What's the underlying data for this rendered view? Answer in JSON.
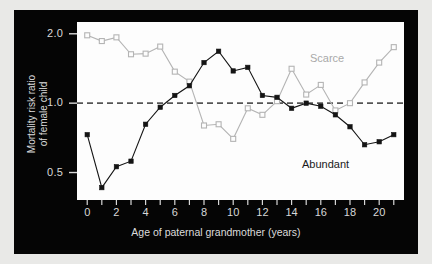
{
  "chart_data": {
    "type": "line",
    "title": "",
    "xlabel": "Age of paternal grandmother (years)",
    "ylabel": "Mortality risk ratio of female child",
    "ylabel_lines": [
      "Mortality risk ratio",
      "of female child"
    ],
    "yscale": "log",
    "ylim": [
      0.38,
      2.25
    ],
    "xlim": [
      -0.7,
      21.7
    ],
    "ytick_labels": [
      "2.0",
      "1.0",
      "0.5"
    ],
    "ytick_values": [
      2.0,
      1.0,
      0.5
    ],
    "xtick_labels": [
      "0",
      "2",
      "4",
      "6",
      "8",
      "10",
      "12",
      "14",
      "16",
      "18",
      "20"
    ],
    "xtick_values": [
      0,
      2,
      4,
      6,
      8,
      10,
      12,
      14,
      16,
      18,
      20
    ],
    "xminor_step": 1,
    "grid": false,
    "reference_line": {
      "value": 1.0,
      "style": "dashed",
      "color": "#555555"
    },
    "legend_position": "inline-annotation",
    "x": [
      0,
      1,
      2,
      3,
      4,
      5,
      6,
      7,
      8,
      9,
      10,
      11,
      12,
      13,
      14,
      15,
      16,
      17,
      18,
      19,
      20,
      21
    ],
    "series": [
      {
        "name": "Scarce",
        "color": "#b4b4b4",
        "marker": "open-square",
        "values": [
          1.97,
          1.86,
          1.93,
          1.63,
          1.64,
          1.76,
          1.37,
          1.24,
          0.8,
          0.81,
          0.7,
          0.95,
          0.89,
          1.02,
          1.41,
          1.09,
          1.2,
          0.93,
          1.0,
          1.23,
          1.5,
          1.75
        ]
      },
      {
        "name": "Abundant",
        "color": "#141414",
        "marker": "filled-square",
        "values": [
          0.73,
          0.43,
          0.53,
          0.56,
          0.81,
          0.96,
          1.08,
          1.19,
          1.5,
          1.68,
          1.38,
          1.43,
          1.08,
          1.06,
          0.95,
          1.0,
          0.97,
          0.89,
          0.79,
          0.66,
          0.68,
          0.73
        ]
      }
    ],
    "annotations": [
      {
        "text": "Scarce",
        "color": "#a9a9a9"
      },
      {
        "text": "Abundant",
        "color": "#1a1a1a"
      }
    ]
  }
}
